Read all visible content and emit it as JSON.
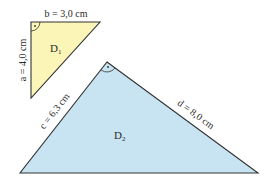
{
  "triangles": [
    {
      "name": "D1",
      "label": "D",
      "subscript": "1",
      "fill": "#fbf5b8",
      "stroke": "#333333",
      "sides": {
        "top": "b = 3,0 cm",
        "left": "a = 4,0 cm"
      },
      "right_angle_marker": "·"
    },
    {
      "name": "D2",
      "label": "D",
      "subscript": "2",
      "fill": "#c8e4f2",
      "stroke": "#333333",
      "sides": {
        "left": "c = 6,3 cm",
        "right": "d = 8,0 cm"
      },
      "right_angle_marker": "·"
    }
  ]
}
